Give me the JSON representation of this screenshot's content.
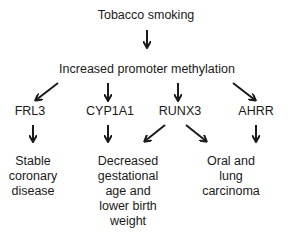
{
  "diagram": {
    "root": "Tobacco smoking",
    "mechanism": "Increased promoter methylation",
    "genes": [
      "FRL3",
      "CYP1A1",
      "RUNX3",
      "AHRR"
    ],
    "outcomes": [
      {
        "lines": [
          "Stable",
          "coronary",
          "disease"
        ]
      },
      {
        "lines": [
          "Decreased",
          "gestational",
          "age and",
          "lower birth",
          "weight"
        ]
      },
      {
        "lines": [
          "Oral and lung",
          "carcinoma"
        ]
      }
    ],
    "edges": [
      [
        "Tobacco smoking",
        "Increased promoter methylation"
      ],
      [
        "Increased promoter methylation",
        "FRL3"
      ],
      [
        "Increased promoter methylation",
        "CYP1A1"
      ],
      [
        "Increased promoter methylation",
        "RUNX3"
      ],
      [
        "Increased promoter methylation",
        "AHRR"
      ],
      [
        "FRL3",
        "Stable coronary disease"
      ],
      [
        "CYP1A1",
        "Decreased gestational age and lower birth weight"
      ],
      [
        "RUNX3",
        "Decreased gestational age and lower birth weight"
      ],
      [
        "RUNX3",
        "Oral and lung carcinoma"
      ],
      [
        "AHRR",
        "Oral and lung carcinoma"
      ]
    ]
  }
}
